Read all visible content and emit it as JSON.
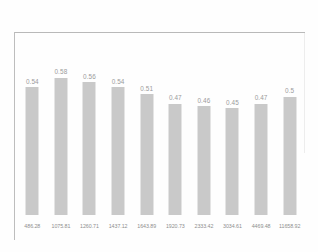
{
  "chart_data": {
    "type": "bar",
    "title": "",
    "xlabel": "",
    "ylabel": "",
    "grid": false,
    "legend": false,
    "ylim": [
      0,
      0.68
    ],
    "bar_color": "#c9c9c9",
    "background_color": "#fefefe",
    "label_color": "#9b9b9b",
    "tick_color": "#8e8e8e",
    "categories": [
      "486.28",
      "1075.81",
      "1260.71",
      "1437.12",
      "1643.89",
      "1920.73",
      "2333.42",
      "3034.61",
      "4469.48",
      "11658.92"
    ],
    "values": [
      0.54,
      0.58,
      0.56,
      0.54,
      0.51,
      0.47,
      0.46,
      0.45,
      0.47,
      0.5
    ],
    "value_labels": [
      "0.54",
      "0.58",
      "0.56",
      "0.54",
      "0.51",
      "0.47",
      "0.46",
      "0.45",
      "0.47",
      "0.5"
    ]
  }
}
